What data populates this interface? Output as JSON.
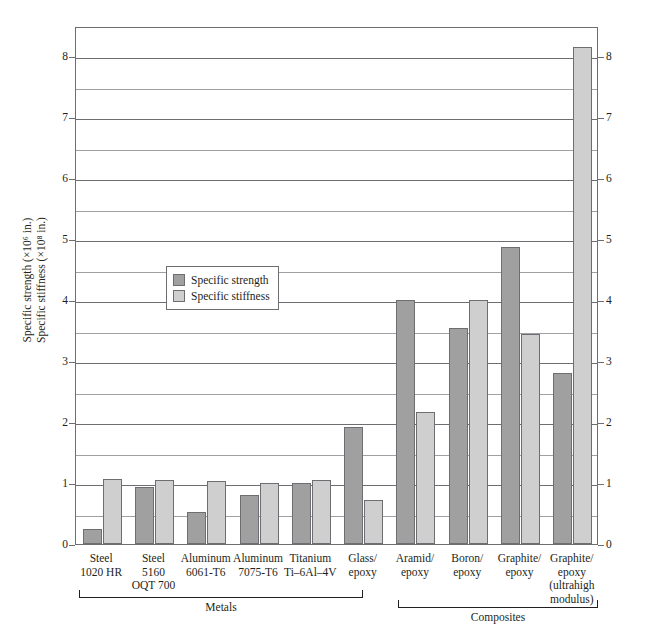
{
  "chart_data": {
    "type": "bar",
    "title": "",
    "xlabel": "",
    "ylabel_line1": "Specific strength (×10⁶ in.)",
    "ylabel_line2": "Specific stiffness (×10⁸ in.)",
    "ylim": [
      0,
      8.5
    ],
    "ytick_values": [
      0,
      1,
      2,
      3,
      4,
      5,
      6,
      7,
      8
    ],
    "ytick_labels": [
      "0",
      "1",
      "2",
      "3",
      "4",
      "5",
      "6",
      "7",
      "8"
    ],
    "minor_gridline_values": [
      0.5,
      1.5,
      2.5,
      3.5,
      4.5,
      5.5,
      6.5,
      7.5
    ],
    "grid": true,
    "legend_position": "inside-left",
    "categories": [
      [
        "Steel",
        "1020 HR"
      ],
      [
        "Steel",
        "5160",
        "OQT 700"
      ],
      [
        "Aluminum",
        "6061-T6"
      ],
      [
        "Aluminum",
        "7075-T6"
      ],
      [
        "Titanium",
        "Ti–6Al–4V"
      ],
      [
        "Glass/",
        "epoxy"
      ],
      [
        "Aramid/",
        "epoxy"
      ],
      [
        "Boron/",
        "epoxy"
      ],
      [
        "Graphite/",
        "epoxy"
      ],
      [
        "Graphite/",
        "epoxy",
        "(ultrahigh",
        "modulus)"
      ]
    ],
    "series": [
      {
        "name": "Specific strength",
        "color": "#a0a0a0",
        "values": [
          0.25,
          0.93,
          0.52,
          0.8,
          1.0,
          1.92,
          4.0,
          3.55,
          4.88,
          2.8
        ]
      },
      {
        "name": "Specific stiffness",
        "color": "#cfcfcf",
        "values": [
          1.07,
          1.05,
          1.03,
          1.0,
          1.05,
          0.72,
          2.17,
          4.0,
          3.45,
          8.15
        ]
      }
    ],
    "groups": [
      {
        "label": "Metals",
        "from": 0,
        "to": 5
      },
      {
        "label": "Composites",
        "from": 6,
        "to": 9
      }
    ]
  },
  "legend": {
    "items": [
      {
        "label": "Specific strength"
      },
      {
        "label": "Specific stiffness"
      }
    ]
  }
}
